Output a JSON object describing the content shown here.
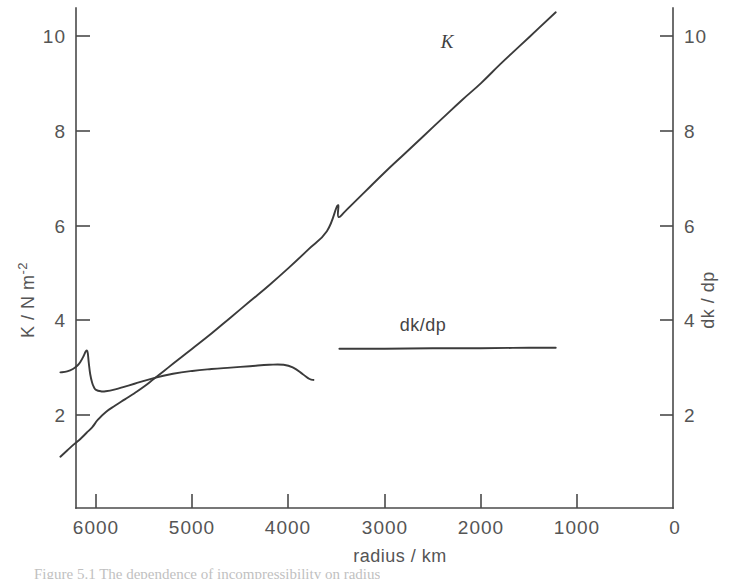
{
  "figure": {
    "caption": "Figure 5.1 The dependence of incompressibility on radius"
  },
  "chart_data": {
    "type": "line",
    "title": "",
    "xlabel": "radius / km",
    "ylabel_left": "K / N m",
    "ylabel_left_sup": "-2",
    "ylabel_right": "dk / dp",
    "xlim": [
      6500,
      0
    ],
    "ylim": [
      0,
      11
    ],
    "grid": false,
    "legend": "inline-annotations",
    "x_ticks": [
      6000,
      5000,
      4000,
      3000,
      2000,
      1000,
      0
    ],
    "x_tick_labels": [
      "6000",
      "5000",
      "4000",
      "3000",
      "2000",
      "1000",
      "0"
    ],
    "y_ticks_left": [
      2,
      4,
      6,
      8,
      10
    ],
    "y_tick_labels_left": [
      "2",
      "4",
      "6",
      "8",
      "10"
    ],
    "y_ticks_right": [
      2,
      4,
      6,
      8,
      10
    ],
    "y_tick_labels_right": [
      "2",
      "4",
      "6",
      "8",
      "10"
    ],
    "series": [
      {
        "name": "K",
        "annotation": "K",
        "annotation_x": 2350,
        "annotation_y": 9.75,
        "note": "incompressibility, rises from crust to core with a discontinuity near r=3480 km",
        "x": [
          6370,
          6300,
          6230,
          6160,
          6100,
          6040,
          5980,
          5900,
          5800,
          5700,
          5600,
          5500,
          5400,
          5300,
          5200,
          5100,
          5000,
          4800,
          4600,
          4400,
          4200,
          4000,
          3800,
          3600,
          3490,
          3480,
          3400,
          3200,
          3000,
          2800,
          2600,
          2400,
          2200,
          2000,
          1800,
          1600,
          1400,
          1221
        ],
        "y": [
          1.12,
          1.25,
          1.38,
          1.5,
          1.62,
          1.74,
          1.9,
          2.06,
          2.2,
          2.33,
          2.46,
          2.6,
          2.76,
          2.92,
          3.08,
          3.24,
          3.4,
          3.72,
          4.06,
          4.4,
          4.74,
          5.1,
          5.48,
          5.88,
          6.42,
          6.18,
          6.32,
          6.72,
          7.12,
          7.5,
          7.88,
          8.26,
          8.64,
          9.0,
          9.4,
          9.78,
          10.16,
          10.5
        ]
      },
      {
        "name": "dk/dp-mantle",
        "annotation": "",
        "note": "pressure derivative of incompressibility in the mantle; hump near 6100 km then drop at 660 km discontinuity region",
        "x": [
          6370,
          6300,
          6240,
          6190,
          6160,
          6130,
          6110,
          6095,
          6085,
          6075,
          6060,
          6040,
          6020,
          6000,
          5950,
          5900,
          5800,
          5700,
          5600,
          5400,
          5200,
          5000,
          4800,
          4600,
          4400,
          4200,
          4050,
          3950,
          3850,
          3780,
          3740
        ],
        "y": [
          2.9,
          2.92,
          2.97,
          3.05,
          3.13,
          3.24,
          3.33,
          3.36,
          3.3,
          3.1,
          2.86,
          2.68,
          2.58,
          2.53,
          2.5,
          2.5,
          2.54,
          2.6,
          2.66,
          2.78,
          2.87,
          2.93,
          2.97,
          3.0,
          3.03,
          3.06,
          3.06,
          3.0,
          2.86,
          2.76,
          2.74
        ]
      },
      {
        "name": "dk/dp-core",
        "annotation": "dk/dp",
        "annotation_x": 2600,
        "annotation_y": 3.78,
        "note": "essentially constant in the outer core",
        "x": [
          3470,
          3000,
          2500,
          2000,
          1500,
          1221
        ],
        "y": [
          3.4,
          3.4,
          3.41,
          3.41,
          3.42,
          3.42
        ]
      }
    ]
  }
}
